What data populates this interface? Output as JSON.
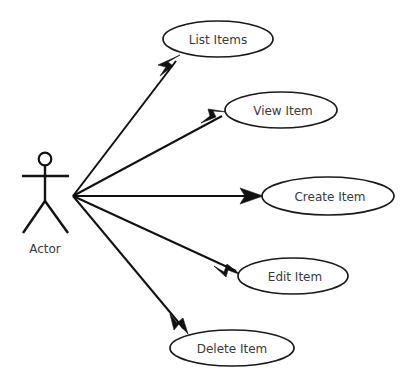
{
  "diagram": {
    "type": "uml-use-case-diagram",
    "title": "",
    "canvas": {
      "width": 405,
      "height": 390,
      "background": "#ffffff"
    },
    "stroke_color": "#111111",
    "text_color": "#3a3a3a",
    "fill_color": "#ffffff"
  },
  "actor": {
    "label": "Actor",
    "icon": "stick-figure",
    "position": {
      "x": 45,
      "y": 196
    },
    "label_position": {
      "x": 45,
      "y": 249
    }
  },
  "use_cases": [
    {
      "id": "list-items",
      "label": "List Items",
      "cx": 218,
      "cy": 39,
      "rx": 55,
      "ry": 18
    },
    {
      "id": "view-item",
      "label": "View Item",
      "cx": 281,
      "cy": 110,
      "rx": 56,
      "ry": 18
    },
    {
      "id": "create-item",
      "label": "Create Item",
      "cx": 328,
      "cy": 196,
      "rx": 66,
      "ry": 19
    },
    {
      "id": "edit-item",
      "label": "Edit Item",
      "cx": 293,
      "cy": 276,
      "rx": 55,
      "ry": 18
    },
    {
      "id": "delete-item",
      "label": "Delete Item",
      "cx": 232,
      "cy": 348,
      "rx": 62,
      "ry": 18
    }
  ],
  "associations": [
    {
      "id": "actor-to-list-items",
      "from": "actor",
      "to": "list-items",
      "x1": 73,
      "y1": 196,
      "x2": 180,
      "y2": 56,
      "arrow": "filled-triangle"
    },
    {
      "id": "actor-to-view-item",
      "from": "actor",
      "to": "view-item",
      "x1": 73,
      "y1": 196,
      "x2": 227,
      "y2": 113,
      "arrow": "filled-triangle"
    },
    {
      "id": "actor-to-create-item",
      "from": "actor",
      "to": "create-item",
      "x1": 73,
      "y1": 196,
      "x2": 263,
      "y2": 196,
      "arrow": "filled-triangle"
    },
    {
      "id": "actor-to-edit-item",
      "from": "actor",
      "to": "edit-item",
      "x1": 73,
      "y1": 196,
      "x2": 241,
      "y2": 275,
      "arrow": "filled-triangle"
    },
    {
      "id": "actor-to-delete-item",
      "from": "actor",
      "to": "delete-item",
      "x1": 73,
      "y1": 196,
      "x2": 188,
      "y2": 334,
      "arrow": "filled-triangle"
    }
  ]
}
